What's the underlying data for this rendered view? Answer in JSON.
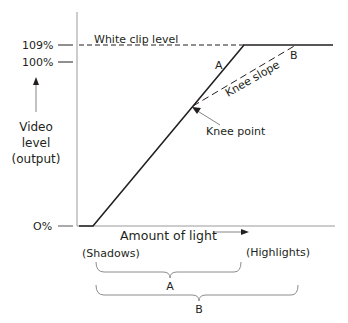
{
  "diagram": {
    "y_axis": {
      "label_lines": [
        "Video",
        "level",
        "(output)"
      ],
      "ticks": [
        {
          "label": "109%",
          "value": 109
        },
        {
          "label": "100%",
          "value": 100
        },
        {
          "label": "O%",
          "value": 0
        }
      ]
    },
    "x_axis": {
      "label": "Amount of light",
      "left_label": "(Shadows)",
      "right_label": "(Highlights)"
    },
    "annotations": {
      "white_clip": "White clip level",
      "curve_a": "A",
      "curve_b": "B",
      "knee_slope": "Knee slope",
      "knee_point": "Knee point"
    },
    "ranges": [
      {
        "label": "A",
        "description": "Input range without knee"
      },
      {
        "label": "B",
        "description": "Input range with knee"
      }
    ],
    "colors": {
      "line": "#231f20",
      "axis": "#8c8c8c",
      "background": "#ffffff"
    }
  }
}
